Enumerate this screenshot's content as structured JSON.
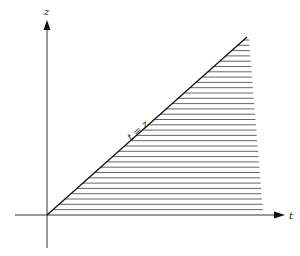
{
  "diagram": {
    "type": "region-plot",
    "axes": {
      "vertical": {
        "label": "z"
      },
      "horizontal": {
        "label": "t"
      }
    },
    "boundary_line": {
      "label": "t = z"
    },
    "region": {
      "description": "hatched region below the line t = z, bounded on the right",
      "hatch": "horizontal"
    },
    "colors": {
      "ink": "#222222",
      "hatch": "#555555",
      "background": "#ffffff"
    }
  }
}
